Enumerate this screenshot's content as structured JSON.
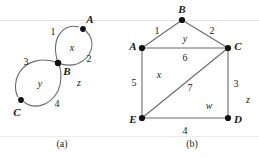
{
  "figure": {
    "name": "two-graph-figure",
    "background": "#ffffff",
    "ink_color": "#555555",
    "node_color": "#111111",
    "text_color": "#1a1a1a",
    "width": 259,
    "height": 157,
    "panels": [
      {
        "id": "a",
        "caption": "(a)",
        "caption_pos": [
          62,
          144
        ],
        "type": "figure-eight-planar-graph",
        "nodes": [
          {
            "id": "A",
            "label": "A",
            "cx": 83,
            "cy": 29,
            "label_pos": [
              90,
              19
            ]
          },
          {
            "id": "B",
            "label": "B",
            "cx": 58,
            "cy": 63,
            "label_pos": [
              67,
              71
            ]
          },
          {
            "id": "C",
            "label": "C",
            "cx": 21,
            "cy": 100,
            "label_pos": [
              17,
              112
            ]
          }
        ],
        "edge_labels": [
          {
            "text": "1",
            "pos": [
              53,
              32
            ]
          },
          {
            "text": "2",
            "pos": [
              89,
              59
            ]
          },
          {
            "text": "3",
            "pos": [
              26,
              62
            ]
          },
          {
            "text": "4",
            "pos": [
              57,
              104
            ]
          }
        ],
        "face_labels": [
          {
            "text": "x",
            "pos": [
              72,
              48
            ]
          },
          {
            "text": "y",
            "pos": [
              40,
              84
            ]
          },
          {
            "text": "z",
            "pos": [
              79,
              83
            ]
          }
        ]
      },
      {
        "id": "b",
        "caption": "(b)",
        "caption_pos": [
          192,
          144
        ],
        "type": "planar-graph",
        "nodes": [
          {
            "id": "B",
            "label": "B",
            "cx": 182,
            "cy": 20,
            "label_pos": [
              182,
              9
            ]
          },
          {
            "id": "A",
            "label": "A",
            "cx": 142,
            "cy": 48,
            "label_pos": [
              133,
              46
            ]
          },
          {
            "id": "C",
            "label": "C",
            "cx": 228,
            "cy": 48,
            "label_pos": [
              238,
              46
            ]
          },
          {
            "id": "E",
            "label": "E",
            "cx": 142,
            "cy": 118,
            "label_pos": [
              133,
              119
            ]
          },
          {
            "id": "D",
            "label": "D",
            "cx": 228,
            "cy": 118,
            "label_pos": [
              238,
              119
            ]
          }
        ],
        "edges": [
          {
            "from": "A",
            "to": "B"
          },
          {
            "from": "B",
            "to": "C"
          },
          {
            "from": "A",
            "to": "C"
          },
          {
            "from": "A",
            "to": "E"
          },
          {
            "from": "C",
            "to": "D"
          },
          {
            "from": "E",
            "to": "D"
          },
          {
            "from": "E",
            "to": "C"
          }
        ],
        "edge_labels": [
          {
            "text": "1",
            "pos": [
              157,
              31
            ]
          },
          {
            "text": "2",
            "pos": [
              212,
              31
            ]
          },
          {
            "text": "6",
            "pos": [
              185,
              58
            ]
          },
          {
            "text": "5",
            "pos": [
              134,
              83
            ]
          },
          {
            "text": "3",
            "pos": [
              236,
              84
            ]
          },
          {
            "text": "7",
            "pos": [
              190,
              88
            ]
          },
          {
            "text": "4",
            "pos": [
              185,
              131
            ]
          }
        ],
        "face_labels": [
          {
            "text": "y",
            "pos": [
              185,
              39
            ]
          },
          {
            "text": "x",
            "pos": [
              159,
              75
            ]
          },
          {
            "text": "w",
            "pos": [
              209,
              106
            ]
          },
          {
            "text": "z",
            "pos": [
              248,
              100
            ]
          }
        ]
      }
    ]
  }
}
